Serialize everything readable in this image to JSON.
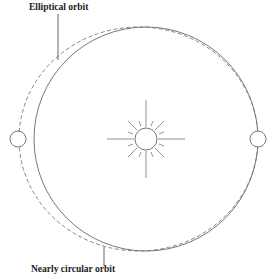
{
  "labels": {
    "elliptical": "Elliptical orbit",
    "circular": "Nearly circular orbit"
  },
  "colors": {
    "line": "#777777",
    "text": "#222222",
    "background": "#ffffff"
  },
  "diagram": {
    "circle_orbit": {
      "cx": 146,
      "cy": 139,
      "r": 112
    },
    "ellipse_orbit": {
      "cx": 138.5,
      "cy": 139,
      "rx": 119.5,
      "ry": 112,
      "style": "dashed"
    },
    "sun": {
      "cx": 146,
      "cy": 139,
      "r": 11
    },
    "planets": [
      {
        "name": "left-planet",
        "cx": 18,
        "cy": 139,
        "r": 8
      },
      {
        "name": "right-planet",
        "cx": 258,
        "cy": 139,
        "r": 8
      }
    ]
  }
}
